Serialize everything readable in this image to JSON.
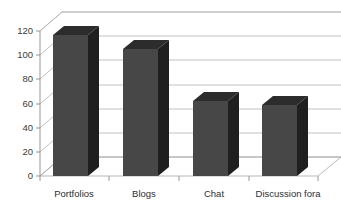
{
  "chart_data": {
    "type": "bar",
    "title": "",
    "subtitle": "",
    "xlabel": "",
    "ylabel": "",
    "categories": [
      "Portfolios",
      "Blogs",
      "Chat",
      "Discussion fora"
    ],
    "values": [
      117,
      105,
      62,
      59
    ],
    "series": [
      {
        "name": "Series 1",
        "values": [
          117,
          105,
          62,
          59
        ]
      }
    ],
    "ylim": [
      0,
      120
    ],
    "ytick_values": [
      0,
      20,
      40,
      60,
      80,
      100,
      120
    ],
    "ytick_labels": [
      "0",
      "20",
      "40",
      "60",
      "80",
      "100",
      "120"
    ],
    "grid": true,
    "grid_axis": "y",
    "legend": false,
    "legend_position": "none",
    "style": "3d-column",
    "annotations": [],
    "colors": {
      "bar_front": "#474747",
      "bar_top": "#2c2c2c",
      "bar_side": "#1f1f1f",
      "gridline": "#a8a8a8",
      "axis": "#8a8a8a",
      "label_text": "#2e2e2e",
      "background": "#ffffff"
    }
  },
  "axis": {
    "y_tick_0": "0",
    "y_tick_1": "20",
    "y_tick_2": "40",
    "y_tick_3": "60",
    "y_tick_4": "80",
    "y_tick_5": "100",
    "y_tick_6": "120"
  },
  "categories": {
    "cat_0": "Portfolios",
    "cat_1": "Blogs",
    "cat_2": "Chat",
    "cat_3": "Discussion fora"
  }
}
